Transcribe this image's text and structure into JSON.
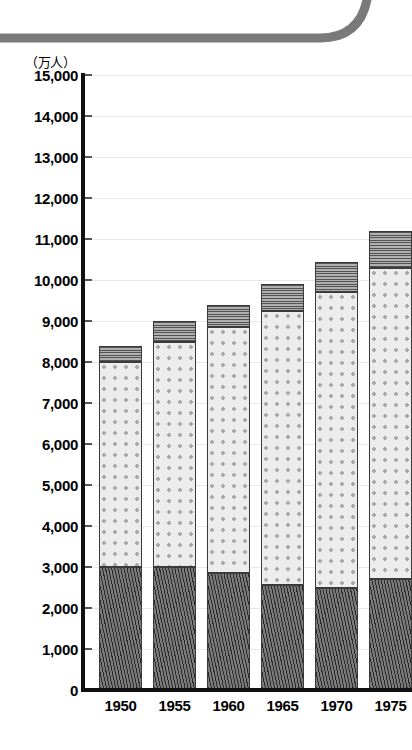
{
  "page": {
    "unit_label": "（万人）",
    "bleed_text": ""
  },
  "decoration": {
    "top_rule_icon": "rounded-corner-rule-icon",
    "color": "#7a7a7a"
  },
  "axes": {
    "y_ticks": [
      "15,000",
      "14,000",
      "13,000",
      "12,000",
      "11,000",
      "10,000",
      "9,000",
      "8,000",
      "7,000",
      "6,000",
      "5,000",
      "4,000",
      "3,000",
      "2,000",
      "1,000",
      "0"
    ],
    "x_ticks": [
      "1950",
      "1955",
      "1960",
      "1965",
      "1970",
      "1975"
    ]
  },
  "chart_data": {
    "type": "bar",
    "title": "",
    "subtitle": "",
    "xlabel": "",
    "ylabel": "（万人）",
    "ylim": [
      0,
      15000
    ],
    "ytick_interval": 1000,
    "grid": true,
    "stacked": true,
    "legend_position": "none",
    "categories": [
      "1950",
      "1955",
      "1960",
      "1965",
      "1970",
      "1975"
    ],
    "series": [
      {
        "name": "bottom-segment",
        "pattern": "dark-diagonal-hatch",
        "color": "#5e5e5e",
        "values": [
          3000,
          3000,
          2850,
          2550,
          2500,
          2700
        ]
      },
      {
        "name": "middle-segment",
        "pattern": "light-dotted",
        "color": "#ececec",
        "values": [
          5000,
          5500,
          6000,
          6700,
          7200,
          7600
        ]
      },
      {
        "name": "top-segment",
        "pattern": "gray-horizontal-hatch",
        "color": "#8e8e8e",
        "values": [
          400,
          500,
          550,
          650,
          750,
          900
        ]
      }
    ],
    "totals": [
      8400,
      9000,
      9400,
      9900,
      10450,
      11200
    ]
  }
}
